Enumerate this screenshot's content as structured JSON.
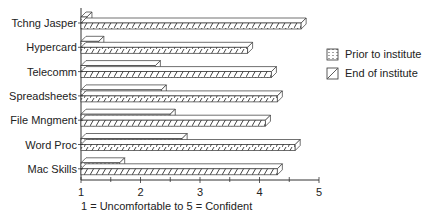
{
  "chart_data": {
    "type": "bar",
    "orientation": "horizontal",
    "style": "3d-pseudo",
    "title": "",
    "xlabel": "1 = Uncomfortable to 5 = Confident",
    "ylabel": "",
    "xlim": [
      1,
      5
    ],
    "x_ticks": [
      "1",
      "2",
      "3",
      "4",
      "5"
    ],
    "grid": false,
    "legend_position": "right",
    "categories": [
      "Tchng Jasper",
      "Hypercard",
      "Telecomm",
      "Spreadsheets",
      "File Mngment",
      "Word Proc",
      "Mac Skills"
    ],
    "series": [
      {
        "name": "Prior to institute",
        "pattern": "dots",
        "values": [
          1.1,
          1.3,
          2.25,
          2.35,
          2.5,
          2.7,
          1.65
        ]
      },
      {
        "name": "End of institute",
        "pattern": "diagonal-hatch",
        "values": [
          4.7,
          3.8,
          4.2,
          4.3,
          4.1,
          4.6,
          4.3
        ]
      }
    ]
  },
  "legend": {
    "items": [
      {
        "label": "Prior to institute",
        "icon": "dotted-swatch-icon"
      },
      {
        "label": "End of institute",
        "icon": "hatched-swatch-icon"
      }
    ]
  }
}
